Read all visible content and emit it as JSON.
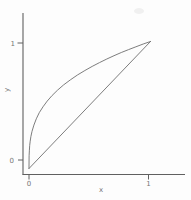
{
  "figure": {
    "background": "#fdfdfd",
    "axis_color": "#606060",
    "curve_color": "#6e6e6e",
    "label_color": "#5d5d5d",
    "smudge_color": "#f0f0f0"
  },
  "chart_data": {
    "type": "line",
    "xlabel": "x",
    "ylabel": "y",
    "xlim": [
      0,
      1
    ],
    "ylim": [
      0,
      1
    ],
    "grid": false,
    "legend": false,
    "x_ticks": [
      {
        "value": 0,
        "label": "0"
      },
      {
        "value": 1,
        "label": "1"
      }
    ],
    "y_ticks": [
      {
        "value": 0,
        "label": "0"
      },
      {
        "value": 1,
        "label": "1"
      }
    ],
    "series": [
      {
        "name": "concave-curve",
        "description": "concave curve approximately y = x^(1/3) from (0,0) to (1,1)",
        "x": [
          0,
          0.001,
          0.003,
          0.006,
          0.01,
          0.016,
          0.025,
          0.04,
          0.06,
          0.085,
          0.115,
          0.15,
          0.19,
          0.235,
          0.285,
          0.34,
          0.4,
          0.46,
          0.52,
          0.58,
          0.64,
          0.7,
          0.76,
          0.82,
          0.88,
          0.94,
          1
        ],
        "y": [
          0,
          0.1,
          0.144,
          0.182,
          0.215,
          0.252,
          0.292,
          0.342,
          0.391,
          0.44,
          0.486,
          0.531,
          0.575,
          0.617,
          0.658,
          0.698,
          0.737,
          0.772,
          0.804,
          0.834,
          0.862,
          0.888,
          0.913,
          0.936,
          0.958,
          0.98,
          1
        ]
      },
      {
        "name": "diagonal-line",
        "description": "straight reference line y = x from (0,0) to (1,1)",
        "x": [
          0,
          1
        ],
        "y": [
          0,
          1
        ]
      }
    ]
  }
}
